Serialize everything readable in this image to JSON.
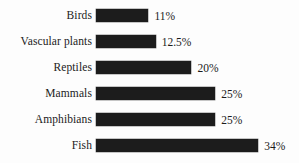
{
  "chart_data": {
    "type": "bar",
    "orientation": "horizontal",
    "title": "",
    "subtitle": "",
    "xlabel": "",
    "ylabel": "",
    "grid": false,
    "legend": "none",
    "xlim": [
      0,
      34
    ],
    "value_suffix": "%",
    "categories": [
      "Birds",
      "Vascular plants",
      "Reptiles",
      "Mammals",
      "Amphibians",
      "Fish"
    ],
    "values": [
      11,
      12.5,
      20,
      25,
      25,
      34
    ],
    "value_labels": [
      "11%",
      "12.5%",
      "20%",
      "25%",
      "25%",
      "34%"
    ],
    "bar_color": "#1c1c1c",
    "background_color": "#fdfdfd",
    "rows": [
      {
        "label": "Birds",
        "value": 11,
        "value_label": "11%"
      },
      {
        "label": "Vascular plants",
        "value": 12.5,
        "value_label": "12.5%"
      },
      {
        "label": "Reptiles",
        "value": 20,
        "value_label": "20%"
      },
      {
        "label": "Mammals",
        "value": 25,
        "value_label": "25%"
      },
      {
        "label": "Amphibians",
        "value": 25,
        "value_label": "25%"
      },
      {
        "label": "Fish",
        "value": 34,
        "value_label": "34%"
      }
    ]
  },
  "layout": {
    "bar_origin_px": 96,
    "px_per_unit": 4.77,
    "row_pitch_px": 26,
    "first_row_top_px": 2
  }
}
